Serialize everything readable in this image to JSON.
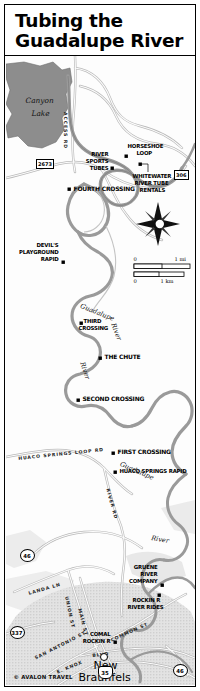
{
  "title": {
    "line1": "Tubing the",
    "line2": "Guadalupe River"
  },
  "credit": "© AVALON TRAVEL",
  "water": {
    "lake_label_line1": "Canyon",
    "lake_label_line2": "Lake",
    "river_name_upper": "Guadalupe",
    "river_name_upper2": "River",
    "river_name_mid": "River",
    "river_name_lower": "Guadalupe",
    "river_name_lower2": "River"
  },
  "city": {
    "name_line1": "New",
    "name_line2": "Braunfels"
  },
  "points_of_interest": [
    {
      "label": "HORSESHOE\nLOOP",
      "name": "horseshoe-loop"
    },
    {
      "label": "RIVER\nSPORTS\nTUBES",
      "name": "river-sports-tubes"
    },
    {
      "label": "WHITEWATER\nRIVER TUBE\nRENTALS",
      "name": "whitewater-river-tube-rentals"
    },
    {
      "label": "FOURTH CROSSING",
      "name": "fourth-crossing"
    },
    {
      "label": "DEVIL'S\nPLAYGROUND\nRAPID",
      "name": "devils-playground-rapid"
    },
    {
      "label": "THIRD\nCROSSING",
      "name": "third-crossing"
    },
    {
      "label": "THE CHUTE",
      "name": "the-chute"
    },
    {
      "label": "SECOND CROSSING",
      "name": "second-crossing"
    },
    {
      "label": "FIRST CROSSING",
      "name": "first-crossing"
    },
    {
      "label": "HUACO SPRINGS RAPID",
      "name": "huaco-springs-rapid"
    },
    {
      "label": "GRUENE\nRIVER\nCOMPANY",
      "name": "gruene-river-company"
    },
    {
      "label": "ROCKIN R\nRIVER RIDES",
      "name": "rockin-r-river-rides"
    },
    {
      "label": "COMAL\nROCKIN R",
      "name": "comal-rockin-r"
    }
  ],
  "labels": {
    "horseshoe_loop_1": "HORSESHOE",
    "horseshoe_loop_2": "LOOP",
    "river_sports_1": "RIVER",
    "river_sports_2": "SPORTS",
    "river_sports_3": "TUBES",
    "whitewater_1": "WHITEWATER",
    "whitewater_2": "RIVER TUBE",
    "whitewater_3": "RENTALS",
    "fourth_crossing": "FOURTH CROSSING",
    "devils_1": "DEVIL'S",
    "devils_2": "PLAYGROUND",
    "devils_3": "RAPID",
    "third_1": "THIRD",
    "third_2": "CROSSING",
    "the_chute": "THE CHUTE",
    "second_crossing": "SECOND CROSSING",
    "first_crossing": "FIRST CROSSING",
    "huaco_springs_rapid": "HUACO SPRINGS RAPID",
    "gruene_1": "GRUENE",
    "gruene_2": "RIVER",
    "gruene_3": "COMPANY",
    "rockin_1": "ROCKIN R",
    "rockin_2": "RIVER RIDES",
    "comal_1": "COMAL",
    "comal_2": "ROCKIN R"
  },
  "roads": {
    "access_rd": "ACCESS RD",
    "huaco_springs_loop_rd": "HUACO SPRINGS LOOP RD",
    "river_rd_mid": "RIVER RD",
    "river_rd_low": "RIVER RD",
    "landa_ln": "LANDA LN",
    "common_st": "COMMON ST",
    "union_st": "UNION ST",
    "main_st": "MAIN ST",
    "san_antonio_st": "SAN ANTONIO ST",
    "e_knox": "E. KNOX",
    "blvd": "BLVD"
  },
  "shields": [
    {
      "id": "2673",
      "type": "rect",
      "name": "highway-shield-2673"
    },
    {
      "id": "306",
      "type": "rect",
      "name": "highway-shield-306"
    },
    {
      "id": "46",
      "type": "circle",
      "name": "highway-shield-46-upper"
    },
    {
      "id": "337",
      "type": "circle",
      "name": "highway-shield-337"
    },
    {
      "id": "35",
      "type": "interstate",
      "name": "highway-shield-i35"
    },
    {
      "id": "46",
      "type": "circle",
      "name": "highway-shield-46-lower"
    }
  ],
  "compass": {
    "label": "compass-rose"
  },
  "scale": {
    "zero_mi": "0",
    "one_mi": "1 mi",
    "zero_km": "0",
    "one_km": "1 km"
  },
  "colors": {
    "river": "#9a9a9a",
    "lake": "#8d8d8d",
    "land": "#ffffff",
    "urban": "#dcdcdc",
    "ink": "#000000"
  }
}
